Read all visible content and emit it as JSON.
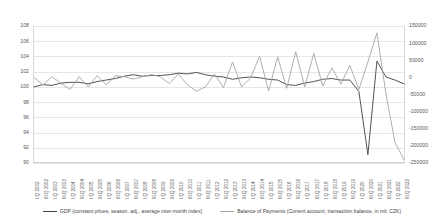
{
  "chart_data": {
    "type": "line",
    "title": "",
    "xlabel": "",
    "ylabel": "",
    "grid": true,
    "legend_position": "bottom",
    "axes": {
      "left": {
        "label": "",
        "ylim": [
          90,
          108
        ],
        "ticks": [
          90,
          92,
          94,
          96,
          98,
          100,
          102,
          104,
          106,
          108
        ],
        "tick_labels": [
          "90",
          "92",
          "94",
          "96",
          "98",
          "100",
          "102",
          "104",
          "106",
          "108"
        ]
      },
      "right": {
        "label": "",
        "ylim": [
          -250000,
          150000
        ],
        "ticks": [
          -250000,
          -200000,
          -150000,
          -100000,
          -50000,
          0,
          50000,
          100000,
          150000
        ],
        "tick_labels": [
          "-250000",
          "-200000",
          "-150000",
          "-100000",
          "-50000",
          "0",
          "50000",
          "100000",
          "150000"
        ]
      }
    },
    "categories": [
      "I.Q 2002",
      "III.Q 2002",
      "I.Q 2003",
      "III.Q 2003",
      "I.Q 2004",
      "III.Q 2004",
      "I.Q 2005",
      "III.Q 2005",
      "I.Q 2006",
      "III.Q 2006",
      "I.Q 2007",
      "III.Q 2007",
      "I.Q 2008",
      "III.Q 2008",
      "I.Q 2009",
      "III.Q 2009",
      "I.Q 2010",
      "III.Q 2010",
      "I.Q 2011",
      "III.Q 2011",
      "I.Q 2012",
      "III.Q 2012",
      "I.Q 2013",
      "III.Q 2013",
      "I.Q 2014",
      "III.Q 2014",
      "I.Q 2015",
      "III.Q 2015",
      "I.Q 2016",
      "III.Q 2016",
      "I.Q 2017",
      "III.Q 2017",
      "I.Q 2018",
      "III.Q 2018",
      "I.Q 2019",
      "III.Q 2019",
      "I.Q 2020",
      "III.Q 2020",
      "I.Q 2021",
      "III.Q 2021",
      "I.Q 2022",
      "III.Q 2022"
    ],
    "series": [
      {
        "name": "GDP (constant prices, season. adj., average inter-month index)",
        "axis": "left",
        "color": "#404040",
        "values": [
          100.0,
          100.3,
          100.2,
          100.5,
          100.6,
          100.6,
          100.4,
          100.7,
          100.9,
          101.1,
          101.4,
          101.6,
          101.4,
          101.5,
          101.5,
          101.6,
          101.8,
          101.7,
          101.9,
          101.6,
          101.4,
          101.3,
          101.0,
          101.2,
          101.3,
          101.2,
          101.0,
          100.9,
          100.3,
          100.2,
          100.5,
          100.7,
          101.0,
          101.1,
          100.9,
          100.9,
          99.4,
          91.1,
          103.4,
          101.3,
          100.9,
          100.4
        ]
      },
      {
        "name": "Balance of Payments (Current account, transaction balance, in mil. CZK)",
        "axis": "right",
        "color": "#a6a6a6",
        "values": [
          0,
          -22000,
          2000,
          -18000,
          -35000,
          2000,
          -28000,
          5000,
          -22000,
          5000,
          2000,
          -5000,
          2000,
          8000,
          2000,
          -18000,
          10000,
          -22000,
          -40000,
          -28000,
          10000,
          -30000,
          45000,
          -28000,
          -2000,
          62000,
          -40000,
          60000,
          -32000,
          75000,
          -28000,
          70000,
          -25000,
          28000,
          -20000,
          35000,
          -35000,
          45000,
          130000,
          -48000,
          -190000,
          -240000
        ]
      }
    ]
  },
  "legend": {
    "items": [
      {
        "label": "GDP (constant prices, season. adj., average inter-month index)",
        "color": "#404040"
      },
      {
        "label": "Balance of Payments (Current account, transaction balance, in mil. CZK)",
        "color": "#a6a6a6"
      }
    ]
  }
}
